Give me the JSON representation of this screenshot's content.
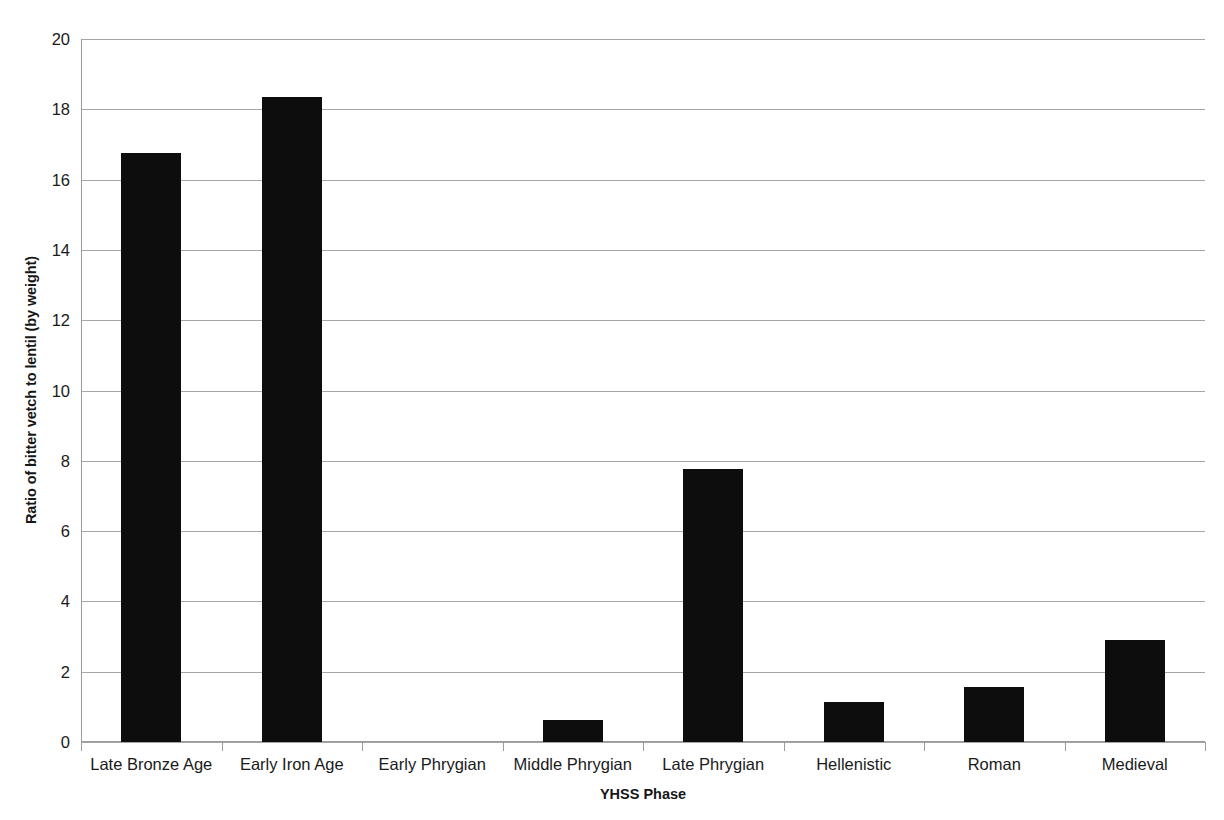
{
  "chart_data": {
    "type": "bar",
    "title": "",
    "xlabel": "YHSS Phase",
    "ylabel": "Ratio of bitter vetch to lentil (by weight)",
    "categories": [
      "Late Bronze Age",
      "Early Iron Age",
      "Early Phrygian",
      "Middle Phrygian",
      "Late Phrygian",
      "Hellenistic",
      "Roman",
      "Medieval"
    ],
    "values": [
      16.75,
      18.35,
      0,
      0.62,
      7.78,
      1.15,
      1.57,
      2.9
    ],
    "ylim": [
      0,
      20
    ],
    "ytick_step": 2,
    "yticks": [
      20,
      18,
      16,
      14,
      12,
      10,
      8,
      6,
      4,
      2,
      0
    ],
    "grid": true,
    "legend": "none",
    "bar_color": "#0d0d0d",
    "gridline_color": "#a6a6a6",
    "axis_color": "#9a9a9a",
    "background_color": "#ffffff"
  }
}
